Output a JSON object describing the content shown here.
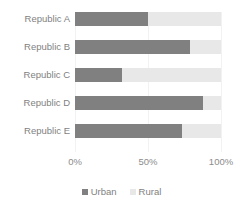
{
  "chart_data": {
    "type": "bar",
    "orientation": "horizontal",
    "stacked": true,
    "title": "",
    "xlabel": "",
    "ylabel": "",
    "categories": [
      "Republic A",
      "Republic B",
      "Republic C",
      "Republic D",
      "Republic E"
    ],
    "series": [
      {
        "name": "Urban",
        "color": "#808080",
        "values": [
          50,
          79,
          32,
          88,
          73
        ]
      },
      {
        "name": "Rural",
        "color": "#e8e8e8",
        "values": [
          50,
          21,
          68,
          12,
          27
        ]
      }
    ],
    "xlim": [
      0,
      100
    ],
    "xticks": [
      0,
      50,
      100
    ],
    "xtick_labels": [
      "0%",
      "50%",
      "100%"
    ],
    "grid": true,
    "legend_position": "bottom",
    "legend": [
      {
        "label": "Urban",
        "color": "#808080"
      },
      {
        "label": "Rural",
        "color": "#e8e8e8"
      }
    ]
  }
}
